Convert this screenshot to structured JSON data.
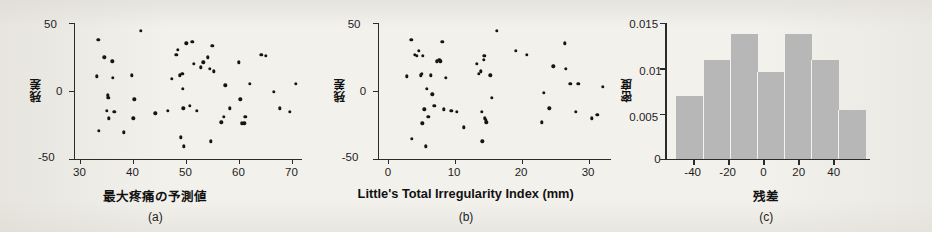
{
  "figure": {
    "background_color": "#f3f1ec",
    "ink_color": "#1d1d1d",
    "bar_color": "#b7b7b7",
    "panels": [
      {
        "id": "a",
        "caption": "(a)"
      },
      {
        "id": "b",
        "caption": "(b)"
      },
      {
        "id": "c",
        "caption": "(c)"
      }
    ]
  },
  "chart_data": [
    {
      "type": "scatter",
      "panel": "a",
      "title": "",
      "xlabel": "最大疼痛の予測値",
      "ylabel": "残差",
      "xlim": [
        28,
        71
      ],
      "ylim": [
        -55,
        52
      ],
      "xticks": [
        30,
        40,
        50,
        60,
        70
      ],
      "yticks": [
        -50,
        0,
        50
      ],
      "xticklabels": [
        "30",
        "40",
        "50",
        "60",
        "70"
      ],
      "yticklabels": [
        "-50",
        "0",
        "50"
      ],
      "grid": false,
      "legend": "none",
      "points": [
        [
          32.3,
          10
        ],
        [
          32.6,
          39
        ],
        [
          32.7,
          -33
        ],
        [
          33.7,
          25
        ],
        [
          34.2,
          -17
        ],
        [
          34.4,
          -5
        ],
        [
          34.5,
          -7
        ],
        [
          34.6,
          -23
        ],
        [
          35.2,
          22
        ],
        [
          35.3,
          9
        ],
        [
          35.6,
          -18
        ],
        [
          37.4,
          -34
        ],
        [
          38.9,
          11
        ],
        [
          39.2,
          -23
        ],
        [
          39.4,
          -8
        ],
        [
          40.6,
          46
        ],
        [
          43.3,
          -19
        ],
        [
          45.7,
          -17
        ],
        [
          46.4,
          8
        ],
        [
          47.3,
          27
        ],
        [
          47.6,
          31
        ],
        [
          47.9,
          11
        ],
        [
          48.2,
          -38
        ],
        [
          48.4,
          12
        ],
        [
          48.5,
          0
        ],
        [
          48.6,
          -15
        ],
        [
          48.7,
          -45
        ],
        [
          49.2,
          36
        ],
        [
          49.8,
          -13
        ],
        [
          50.3,
          37
        ],
        [
          50.6,
          20
        ],
        [
          51.2,
          -17
        ],
        [
          51.9,
          17
        ],
        [
          52.4,
          21
        ],
        [
          53.2,
          25
        ],
        [
          53.6,
          16
        ],
        [
          53.8,
          -41
        ],
        [
          54.1,
          34
        ],
        [
          54.4,
          14
        ],
        [
          55.8,
          -26
        ],
        [
          56.2,
          -22
        ],
        [
          56.5,
          3
        ],
        [
          57.4,
          -15
        ],
        [
          59.1,
          21
        ],
        [
          59.4,
          -8
        ],
        [
          59.6,
          -27
        ],
        [
          60.1,
          -27
        ],
        [
          60.3,
          -22
        ],
        [
          61.1,
          4
        ],
        [
          63.3,
          27
        ],
        [
          64.2,
          26
        ],
        [
          65.7,
          -2
        ],
        [
          66.8,
          -15
        ],
        [
          68.7,
          -18
        ],
        [
          69.8,
          4
        ]
      ]
    },
    {
      "type": "scatter",
      "panel": "b",
      "title": "",
      "xlabel": "Little's Total Irregularity Index (mm)",
      "ylabel": "残差",
      "xlim": [
        -1.5,
        33
      ],
      "ylim": [
        -55,
        52
      ],
      "xticks": [
        0,
        10,
        20,
        30
      ],
      "yticks": [
        -50,
        0,
        50
      ],
      "xticklabels": [
        "0",
        "10",
        "20",
        "30"
      ],
      "yticklabels": [
        "-50",
        "0",
        "50"
      ],
      "grid": false,
      "legend": "none",
      "points": [
        [
          2.8,
          10
        ],
        [
          3.5,
          39
        ],
        [
          3.6,
          -39
        ],
        [
          4.0,
          27
        ],
        [
          4.3,
          26
        ],
        [
          4.6,
          30
        ],
        [
          4.9,
          11
        ],
        [
          5.0,
          12
        ],
        [
          5.1,
          -27
        ],
        [
          5.2,
          26
        ],
        [
          5.4,
          -16
        ],
        [
          5.6,
          -45
        ],
        [
          5.8,
          0
        ],
        [
          6.0,
          -22
        ],
        [
          6.4,
          11
        ],
        [
          6.6,
          -4
        ],
        [
          6.9,
          -13
        ],
        [
          7.3,
          22
        ],
        [
          7.6,
          23
        ],
        [
          7.8,
          22
        ],
        [
          8.1,
          37
        ],
        [
          8.3,
          -16
        ],
        [
          8.6,
          9
        ],
        [
          9.4,
          -17
        ],
        [
          10.2,
          -18
        ],
        [
          11.3,
          -30
        ],
        [
          13.2,
          20
        ],
        [
          13.5,
          12
        ],
        [
          13.8,
          14
        ],
        [
          13.9,
          -18
        ],
        [
          14.0,
          -41
        ],
        [
          14.2,
          23
        ],
        [
          14.3,
          26
        ],
        [
          14.4,
          -23
        ],
        [
          14.5,
          -24
        ],
        [
          14.6,
          -26
        ],
        [
          15.2,
          11
        ],
        [
          15.4,
          -7
        ],
        [
          16.1,
          46
        ],
        [
          19.0,
          30
        ],
        [
          20.6,
          27
        ],
        [
          22.8,
          -26
        ],
        [
          23.1,
          -3
        ],
        [
          23.9,
          -15
        ],
        [
          24.5,
          18
        ],
        [
          26.2,
          36
        ],
        [
          26.4,
          16
        ],
        [
          27.0,
          4
        ],
        [
          27.8,
          -18
        ],
        [
          28.2,
          4
        ],
        [
          30.2,
          -23
        ],
        [
          31.0,
          -20
        ],
        [
          31.8,
          2
        ]
      ]
    },
    {
      "type": "bar",
      "panel": "c",
      "title": "",
      "xlabel": "残差",
      "ylabel": "密度",
      "xlim": [
        -55,
        53
      ],
      "ylim": [
        0,
        0.0158
      ],
      "xticks": [
        -40,
        -20,
        0,
        20,
        40
      ],
      "yticks": [
        0,
        0.005,
        0.01,
        0.015
      ],
      "xticklabels": [
        "-40",
        "-20",
        "0",
        "20",
        "40"
      ],
      "yticklabels": [
        "0",
        "0.005",
        "0.01",
        "0.015"
      ],
      "grid": false,
      "legend": "none",
      "bin_edges": [
        -50,
        -35.7,
        -21.4,
        -7.1,
        7.1,
        21.4,
        35.7,
        50
      ],
      "categories": [
        "-50 to -35.7",
        "-35.7 to -21.4",
        "-21.4 to -7.1",
        "-7.1 to 7.1",
        "7.1 to 21.4",
        "21.4 to 35.7",
        "35.7 to 50"
      ],
      "values": [
        0.0073,
        0.0115,
        0.0145,
        0.0101,
        0.0145,
        0.0115,
        0.0057
      ]
    }
  ]
}
